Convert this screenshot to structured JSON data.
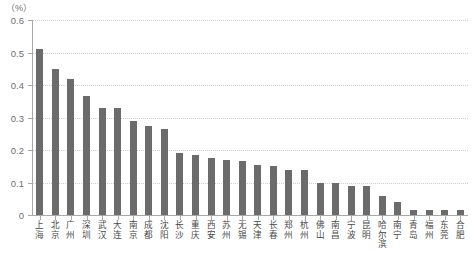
{
  "chart_data": {
    "type": "bar",
    "title": "",
    "subtitle": "",
    "xlabel": "",
    "ylabel": "",
    "unit_label": "（%）",
    "ylim": [
      0,
      0.6
    ],
    "ytick_labels": [
      "0.6",
      "0.5",
      "0.4",
      "0.3",
      "0.2",
      "0.1",
      "0"
    ],
    "ytick_values": [
      0.6,
      0.5,
      0.4,
      0.3,
      0.2,
      0.1,
      0
    ],
    "grid": true,
    "legend": "none",
    "bar_color": "#6b6b6b",
    "grid_color": "#cfcfcf",
    "axis_color": "#a9a9a9",
    "categories": [
      "上海",
      "北京",
      "广州",
      "深圳",
      "武汉",
      "大连",
      "南京",
      "成都",
      "沈阳",
      "长沙",
      "重庆",
      "西安",
      "苏州",
      "无锡",
      "天津",
      "长春",
      "郑州",
      "杭州",
      "佛山",
      "南昌",
      "宁波",
      "昆明",
      "哈尔滨",
      "南宁",
      "青岛",
      "福州",
      "东莞",
      "合肥"
    ],
    "values": [
      0.51,
      0.45,
      0.42,
      0.365,
      0.33,
      0.33,
      0.29,
      0.275,
      0.265,
      0.19,
      0.185,
      0.175,
      0.17,
      0.165,
      0.155,
      0.15,
      0.14,
      0.14,
      0.1,
      0.1,
      0.09,
      0.09,
      0.06,
      0.04,
      0.015,
      0.015,
      0.015,
      0.015
    ]
  }
}
